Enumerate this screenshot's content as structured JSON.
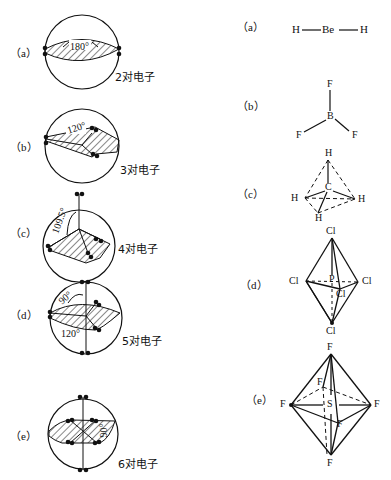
{
  "left_column": {
    "title": "VSEPR electron-pair arrangements",
    "items": [
      {
        "label": "（a）",
        "angle": "180°",
        "caption": "2对电子"
      },
      {
        "label": "（b）",
        "angle": "120°",
        "caption": "3对电子"
      },
      {
        "label": "（c）",
        "angle": "109.5°",
        "caption": "4对电子"
      },
      {
        "label": "（d）",
        "angle_top": "90°",
        "angle_bottom": "120°",
        "caption": "5对电子"
      },
      {
        "label": "（e）",
        "angle": "90°",
        "caption": "6对电子"
      }
    ]
  },
  "right_column": {
    "items": [
      {
        "label": "（a）",
        "center": "Be",
        "ligands": [
          "H",
          "H"
        ]
      },
      {
        "label": "（b）",
        "center": "B",
        "ligands": [
          "F",
          "F",
          "F"
        ]
      },
      {
        "label": "（c）",
        "center": "C",
        "ligands": [
          "H",
          "H",
          "H",
          "H"
        ]
      },
      {
        "label": "（d）",
        "center": "P",
        "ligands": [
          "Cl",
          "Cl",
          "Cl",
          "Cl",
          "Cl"
        ]
      },
      {
        "label": "（e）",
        "center": "S",
        "ligands": [
          "F",
          "F",
          "F",
          "F",
          "F",
          "F"
        ]
      }
    ]
  }
}
